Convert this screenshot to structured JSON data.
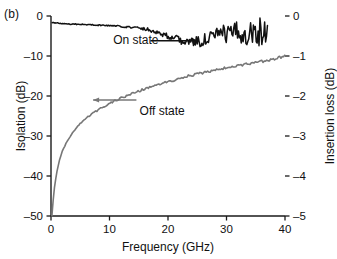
{
  "figure": {
    "panel_label": "(b)",
    "background": "#ffffff"
  },
  "chart_data": {
    "type": "line",
    "title": "",
    "subtitle": "",
    "xlabel": "Frequency (GHz)",
    "ylabel": "Isolation (dB)",
    "y2label": "Insertion loss (dB)",
    "xlim": [
      0,
      40
    ],
    "ylim": [
      -50,
      0
    ],
    "y2lim": [
      -5,
      0
    ],
    "xticks": [
      0,
      10,
      20,
      30,
      40
    ],
    "xticklabels": [
      "0",
      "10",
      "20",
      "30",
      "40"
    ],
    "yticks": [
      0,
      -10,
      -20,
      -30,
      -40,
      -50
    ],
    "yticklabels": [
      "0",
      "–10",
      "–20",
      "–30",
      "–40",
      "–50"
    ],
    "y2ticks": [
      0,
      -1,
      -2,
      -3,
      -4,
      -5
    ],
    "y2ticklabels": [
      "0",
      "–1",
      "–2",
      "–3",
      "–4",
      "–5"
    ],
    "grid": false,
    "legend_position": "inline-annotations",
    "annotations": [
      {
        "name": "on-state",
        "text": "On state",
        "arrow_direction": "right",
        "color": "#111111",
        "x_text": 14.5,
        "y_text": -6.0
      },
      {
        "name": "off-state",
        "text": "Off state",
        "arrow_direction": "left",
        "color": "#777777",
        "x_text": 19.0,
        "y_text": -21.5
      }
    ],
    "series": [
      {
        "name": "On state",
        "axis": "right",
        "color": "#111111",
        "units": "dB",
        "description": "Insertion loss versus frequency, noisy trace ending near 37 GHz",
        "x": [
          0.2,
          0.6,
          1.0,
          1.5,
          2.0,
          2.6,
          3.2,
          4.0,
          4.8,
          5.6,
          6.4,
          7.2,
          8.0,
          8.8,
          9.6,
          10.4,
          11.2,
          12.0,
          12.8,
          13.6,
          14.4,
          15.2,
          16.0,
          16.8,
          17.6,
          18.4,
          19.2,
          20.0,
          20.8,
          21.6,
          22.4,
          23.2,
          24.0,
          24.8,
          25.6,
          26.4,
          27.2,
          28.0,
          28.8,
          29.6,
          30.4,
          31.2,
          32.0,
          32.8,
          33.6,
          34.4,
          35.2,
          36.0,
          36.6,
          37.0
        ],
        "y": [
          -0.16,
          -0.17,
          -0.18,
          -0.18,
          -0.19,
          -0.19,
          -0.2,
          -0.2,
          -0.21,
          -0.21,
          -0.22,
          -0.22,
          -0.23,
          -0.23,
          -0.24,
          -0.24,
          -0.25,
          -0.26,
          -0.27,
          -0.28,
          -0.29,
          -0.3,
          -0.32,
          -0.34,
          -0.38,
          -0.42,
          -0.46,
          -0.5,
          -0.54,
          -0.58,
          -0.62,
          -0.64,
          -0.66,
          -0.65,
          -0.62,
          -0.58,
          -0.54,
          -0.5,
          -0.47,
          -0.45,
          -0.44,
          -0.43,
          -0.42,
          -0.41,
          -0.4,
          -0.4,
          -0.39,
          -0.38,
          -0.38,
          -0.37
        ]
      },
      {
        "name": "Off state",
        "axis": "left",
        "color": "#777777",
        "units": "dB",
        "description": "Isolation versus frequency, rising steeply from -50 dB at 0 GHz to about -10 dB at 40 GHz",
        "x": [
          0.15,
          0.3,
          0.5,
          0.7,
          0.9,
          1.2,
          1.5,
          1.9,
          2.3,
          2.8,
          3.4,
          4.0,
          4.8,
          5.6,
          6.5,
          7.5,
          8.5,
          9.6,
          10.8,
          12.0,
          13.3,
          14.6,
          16.0,
          17.5,
          19.0,
          20.5,
          22.0,
          23.5,
          25.0,
          26.5,
          28.0,
          29.5,
          31.0,
          32.5,
          34.0,
          35.5,
          37.0,
          38.5,
          40.0
        ],
        "y": [
          -50.0,
          -47.2,
          -44.0,
          -41.6,
          -39.8,
          -37.6,
          -35.8,
          -34.0,
          -32.6,
          -31.2,
          -29.8,
          -28.6,
          -27.2,
          -26.1,
          -25.0,
          -24.0,
          -23.1,
          -22.2,
          -21.3,
          -20.5,
          -19.7,
          -19.0,
          -18.2,
          -17.5,
          -16.8,
          -16.2,
          -15.6,
          -15.0,
          -14.5,
          -14.0,
          -13.5,
          -13.1,
          -12.7,
          -12.3,
          -11.9,
          -11.5,
          -11.1,
          -10.6,
          -10.1
        ]
      }
    ]
  }
}
